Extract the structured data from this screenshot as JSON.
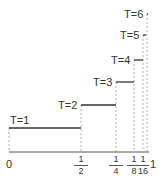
{
  "diagram": {
    "steps": [
      {
        "label": "T=1",
        "x_start": "0",
        "x_end": "1/2"
      },
      {
        "label": "T=2",
        "x_start": "1/2",
        "x_end": "3/4"
      },
      {
        "label": "T=3",
        "x_start": "3/4",
        "x_end": "7/8"
      },
      {
        "label": "T=4",
        "x_start": "7/8",
        "x_end": "15/16"
      },
      {
        "label": "T=5",
        "x_start": "15/16",
        "x_end": "31/32"
      },
      {
        "label": "T=6",
        "x_start": "31/32",
        "x_end": "1"
      }
    ],
    "axis": {
      "zero_label": "0",
      "one_label": "1",
      "ticks": [
        {
          "num": "1",
          "den": "2"
        },
        {
          "num": "1",
          "den": "4"
        },
        {
          "num": "1",
          "den": "8"
        },
        {
          "num": "1",
          "den": "16"
        }
      ]
    },
    "colors": {
      "line": "#333333",
      "dashed": "#999999"
    }
  }
}
